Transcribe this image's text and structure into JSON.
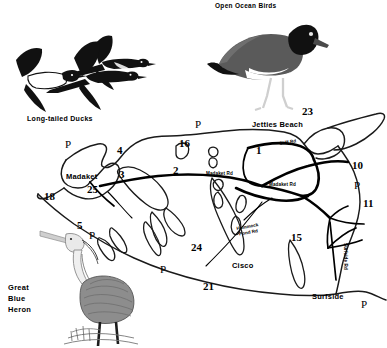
{
  "page": {
    "background_color": "#ffffff",
    "ink_color": "#1a1a1a",
    "kind": "birding-site-map-with-illustrations"
  },
  "captions": {
    "open_ocean_birds": "Open Ocean Birds",
    "long_tailed_ducks": "Long-tailed Ducks",
    "great_blue_heron_line1": "Great",
    "great_blue_heron_line2": "Blue",
    "great_blue_heron_line3": "Heron"
  },
  "illustrations": [
    {
      "name": "long-tailed-ducks-illustration",
      "caption": "Long-tailed Ducks"
    },
    {
      "name": "american-oystercatcher-illustration",
      "caption": "Open Ocean Birds"
    },
    {
      "name": "great-blue-heron-illustration",
      "caption": "Great Blue Heron"
    }
  ],
  "map": {
    "place_labels": [
      {
        "text": "Jetties Beach",
        "x": 252,
        "y": 124
      },
      {
        "text": "Madaket",
        "x": 66,
        "y": 177
      },
      {
        "text": "Cisco",
        "x": 232,
        "y": 266
      },
      {
        "text": "Surfside",
        "x": 312,
        "y": 297
      }
    ],
    "road_labels": [
      {
        "text": "Cliff Rd",
        "x": 279,
        "y": 145
      },
      {
        "text": "Madaket Rd",
        "x": 206,
        "y": 174
      },
      {
        "text": "Madaket Rd",
        "x": 269,
        "y": 185
      },
      {
        "text": "Hummock",
        "x": 243,
        "y": 228
      },
      {
        "text": "Pond Rd",
        "x": 243,
        "y": 234
      },
      {
        "text": "Surfside Rd",
        "x": 345,
        "y": 252
      }
    ],
    "site_numbers": [
      {
        "label": "23",
        "x": 307,
        "y": 113
      },
      {
        "label": "16",
        "x": 185,
        "y": 145
      },
      {
        "label": "4",
        "x": 120,
        "y": 152
      },
      {
        "label": "1",
        "x": 259,
        "y": 152
      },
      {
        "label": "10",
        "x": 357,
        "y": 167
      },
      {
        "label": "2",
        "x": 176,
        "y": 172
      },
      {
        "label": "3",
        "x": 122,
        "y": 176
      },
      {
        "label": "25",
        "x": 93,
        "y": 191
      },
      {
        "label": "18",
        "x": 50,
        "y": 198
      },
      {
        "label": "11",
        "x": 368,
        "y": 205
      },
      {
        "label": "5",
        "x": 80,
        "y": 227
      },
      {
        "label": "24",
        "x": 197,
        "y": 249
      },
      {
        "label": "15",
        "x": 296,
        "y": 239
      },
      {
        "label": "21",
        "x": 208,
        "y": 288
      }
    ],
    "parking_markers": [
      {
        "label": "P",
        "x": 68,
        "y": 146
      },
      {
        "label": "P",
        "x": 198,
        "y": 126
      },
      {
        "label": "P",
        "x": 92,
        "y": 237
      },
      {
        "label": "P",
        "x": 163,
        "y": 271
      },
      {
        "label": "P",
        "x": 357,
        "y": 187
      },
      {
        "label": "P",
        "x": 364,
        "y": 306
      }
    ]
  }
}
